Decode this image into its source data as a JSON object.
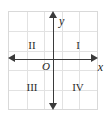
{
  "figure": {
    "kind": "cartesian-coordinate-plane",
    "background_color": "#ffffff",
    "box": {
      "border_color": "#d9d9d9",
      "grid_color": "#e2e2e2",
      "grid_columns": 5,
      "grid_rows": 5
    },
    "axes": {
      "color": "#3a3a3a",
      "x_label": "x",
      "y_label": "y",
      "origin_label": "O",
      "arrowheads": [
        "left",
        "right",
        "up",
        "down"
      ]
    },
    "quadrants": [
      {
        "id": "I",
        "label": "I",
        "position": "upper-right"
      },
      {
        "id": "II",
        "label": "II",
        "position": "upper-left"
      },
      {
        "id": "III",
        "label": "III",
        "position": "lower-left"
      },
      {
        "id": "IV",
        "label": "IV",
        "position": "lower-right"
      }
    ]
  }
}
